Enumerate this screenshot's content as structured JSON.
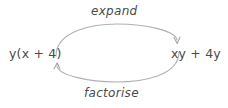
{
  "diagram": {
    "type": "cycle-diagram",
    "background_color": "#ffffff",
    "stroke_color": "#b0b0b0",
    "text_color": "#4a4a4a",
    "nodes": [
      {
        "id": "left",
        "label": "y(x + 4)",
        "position": "left"
      },
      {
        "id": "right",
        "label": "xy + 4y",
        "position": "right"
      }
    ],
    "arrows": [
      {
        "id": "top",
        "label": "expand",
        "from": "left",
        "to": "right",
        "direction": "clockwise",
        "position": "top"
      },
      {
        "id": "bottom",
        "label": "factorise",
        "from": "right",
        "to": "left",
        "direction": "counter-clockwise",
        "position": "bottom"
      }
    ]
  }
}
